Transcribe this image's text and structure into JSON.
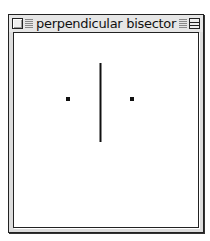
{
  "window": {
    "title": "perpendicular bisector",
    "close_icon": "close-box-icon",
    "zoom_icon": "zoom-box-icon"
  },
  "canvas": {
    "points": [
      {
        "name": "point-a",
        "x": 67,
        "y": 98
      },
      {
        "name": "point-b",
        "x": 130,
        "y": 98
      }
    ],
    "bisector": {
      "x": 99,
      "y1": 62,
      "y2": 141
    },
    "colors": {
      "stroke": "#111111",
      "background": "#ffffff"
    }
  }
}
